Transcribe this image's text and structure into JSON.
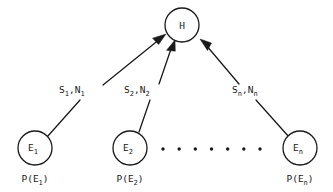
{
  "diagram": {
    "background_color": "#ffffff",
    "stroke_color": "#1a1a1a",
    "hypothesis": {
      "id": "H",
      "label": "H",
      "cx": 182,
      "cy": 25,
      "r": 17
    },
    "evidence_nodes": [
      {
        "id": "E1",
        "label_base": "E",
        "label_sub": "1",
        "prob_prefix": "P(E",
        "prob_sub": "1",
        "prob_suffix": ")",
        "cx": 35,
        "cy": 148,
        "r": 17
      },
      {
        "id": "E2",
        "label_base": "E",
        "label_sub": "2",
        "prob_prefix": "P(E",
        "prob_sub": "2",
        "prob_suffix": ")",
        "cx": 130,
        "cy": 148,
        "r": 17
      },
      {
        "id": "En",
        "label_base": "E",
        "label_sub": "n",
        "prob_prefix": "P(E",
        "prob_sub": "n",
        "prob_suffix": ")",
        "cx": 300,
        "cy": 148,
        "r": 17
      }
    ],
    "edge_labels": [
      {
        "id": "edge-label-1",
        "s_base": "S",
        "s_sub": "1",
        "comma": ",",
        "n_base": "N",
        "n_sub": "1",
        "x": 59,
        "y": 93
      },
      {
        "id": "edge-label-2",
        "s_base": "S",
        "s_sub": "2",
        "comma": ",",
        "n_base": "N",
        "n_sub": "2",
        "x": 124,
        "y": 93
      },
      {
        "id": "edge-label-n",
        "s_base": "S",
        "s_sub": "n",
        "comma": ",",
        "n_base": "N",
        "n_sub": "n",
        "x": 232,
        "y": 93
      }
    ],
    "ellipsis": {
      "dot_count": 7,
      "start_x": 163,
      "end_x": 260,
      "y": 149,
      "radius": 1.7
    }
  }
}
